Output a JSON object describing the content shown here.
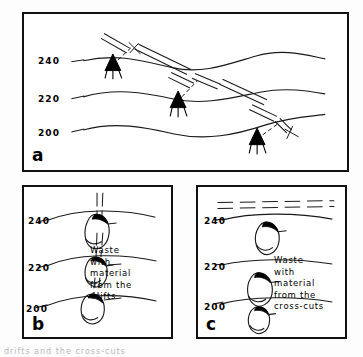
{
  "figure": {
    "caption_fragment": "drifts and the cross-cuts"
  },
  "panels": [
    {
      "id": "a",
      "letter": "a",
      "contour_labels": [
        "240",
        "220",
        "200"
      ],
      "symbols": {
        "adit_portal": "black-wedge-adit-symbol",
        "drift": "dashed-double-line-drift",
        "inclined_shaft": "inclined-double-line"
      },
      "description": "Oblique view: three surface contours with adit portals and inclined drifts"
    },
    {
      "id": "b",
      "letter": "b",
      "contour_labels": [
        "240",
        "220",
        "200"
      ],
      "annotation": [
        "Waste",
        "with",
        "material",
        "from  the",
        "drifts"
      ],
      "symbols": {
        "drift": "vertical-dashed-double-line-drift",
        "waste_pile": "teardrop-waste-dump-symbol"
      },
      "waste_pile_count": 3
    },
    {
      "id": "c",
      "letter": "c",
      "contour_labels": [
        "240",
        "220",
        "200"
      ],
      "annotation": [
        "Waste",
        "with",
        "material",
        "from  the",
        "cross-cuts"
      ],
      "symbols": {
        "cross_cut": "horizontal-dashed-double-line-cross-cut",
        "waste_pile": "teardrop-waste-dump-symbol"
      },
      "waste_pile_count": 3
    }
  ],
  "colors": {
    "ink": "#111111",
    "fill": "#000000",
    "background": "#ffffff"
  }
}
